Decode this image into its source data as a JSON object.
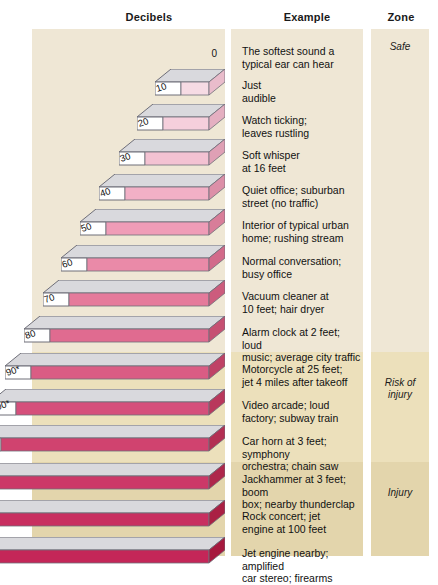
{
  "headers": {
    "decibels": "Decibels",
    "example": "Example",
    "zone": "Zone"
  },
  "zones": [
    {
      "id": "safe",
      "label": "Safe",
      "color": "#efe7d5"
    },
    {
      "id": "risk",
      "label": "Risk of\ninjury",
      "label_line1": "Risk of",
      "label_line2": "injury",
      "color": "#ece0bb"
    },
    {
      "id": "injury",
      "label": "Injury",
      "color": "#e3d5ac"
    }
  ],
  "chart_data": {
    "type": "bar",
    "xlabel": "Decibels",
    "ylabel": "",
    "categories": [
      "0",
      "10",
      "20",
      "30",
      "40",
      "50",
      "60",
      "70",
      "80",
      "90*",
      "100*",
      "110*",
      "120",
      "130",
      "140"
    ],
    "values": [
      0,
      10,
      20,
      30,
      40,
      50,
      60,
      70,
      80,
      90,
      100,
      110,
      120,
      130,
      140
    ],
    "xlim": [
      0,
      140
    ],
    "grid": false,
    "legend": "none",
    "series": [
      {
        "name": "Sound level (dB)",
        "values": [
          0,
          10,
          20,
          30,
          40,
          50,
          60,
          70,
          80,
          90,
          100,
          110,
          120,
          130,
          140
        ]
      }
    ]
  },
  "rows": [
    {
      "db": "0",
      "top": 6,
      "barwidth": 0,
      "fill": "",
      "shade": "",
      "zone": "safe",
      "example": [
        "The softest sound a",
        "typical ear can hear"
      ]
    },
    {
      "db": "10",
      "top": 40,
      "barwidth": 28,
      "fill": "#f6dbe4",
      "shade": "#e9bccb",
      "zone": "safe",
      "example": [
        "Just",
        "audible"
      ]
    },
    {
      "db": "20",
      "top": 75,
      "barwidth": 46,
      "fill": "#f5cfdc",
      "shade": "#e4afc1",
      "zone": "safe",
      "example": [
        "Watch ticking;",
        "leaves rustling"
      ]
    },
    {
      "db": "30",
      "top": 110,
      "barwidth": 64,
      "fill": "#f3c2d2",
      "shade": "#dfa0b5",
      "zone": "safe",
      "example": [
        "Soft whisper",
        "at 16 feet"
      ]
    },
    {
      "db": "40",
      "top": 145,
      "barwidth": 84,
      "fill": "#f2b0c6",
      "shade": "#dc8fa8",
      "zone": "safe",
      "example": [
        "Quiet office; suburban",
        "street (no traffic)"
      ]
    },
    {
      "db": "50",
      "top": 180,
      "barwidth": 103,
      "fill": "#ef9cb7",
      "shade": "#d87d99",
      "zone": "safe",
      "example": [
        "Interior of typical urban",
        "home; rushing stream"
      ]
    },
    {
      "db": "60",
      "top": 216,
      "barwidth": 122,
      "fill": "#ea8aa8",
      "shade": "#d26a8a",
      "zone": "safe",
      "example": [
        "Normal conversation;",
        "busy office"
      ]
    },
    {
      "db": "70",
      "top": 251,
      "barwidth": 140,
      "fill": "#e57a9b",
      "shade": "#cc5c7d",
      "zone": "safe",
      "example": [
        "Vacuum cleaner at",
        "10 feet; hair dryer"
      ]
    },
    {
      "db": "80",
      "top": 287,
      "barwidth": 159,
      "fill": "#e06b90",
      "shade": "#c64f72",
      "zone": "safe",
      "example": [
        "Alarm clock at 2 feet; loud",
        "music; average city traffic"
      ]
    },
    {
      "db": "90*",
      "top": 324,
      "barwidth": 178,
      "fill": "#da5c84",
      "shade": "#bf4266",
      "zone": "risk",
      "example": [
        "Motorcycle at 25 feet;",
        "jet 4 miles after takeoff"
      ]
    },
    {
      "db": "100*",
      "top": 360,
      "barwidth": 193,
      "fill": "#d54f7b",
      "shade": "#b9375c",
      "zone": "risk",
      "example": [
        "Video arcade; loud",
        "factory; subway train"
      ]
    },
    {
      "db": "110*",
      "top": 396,
      "barwidth": 208,
      "fill": "#d0436f",
      "shade": "#b32f53",
      "zone": "risk",
      "example": [
        "Car horn at 3 feet; symphony",
        "orchestra; chain saw"
      ]
    },
    {
      "db": "120",
      "top": 434,
      "barwidth": 226,
      "fill": "#cc3868",
      "shade": "#ae274b",
      "zone": "injury",
      "example": [
        "Jackhammer at 3 feet; boom",
        "box; nearby thunderclap"
      ]
    },
    {
      "db": "130",
      "top": 471,
      "barwidth": 242,
      "fill": "#c82f60",
      "shade": "#aa2044",
      "zone": "injury",
      "example": [
        "Rock concert; jet",
        "engine at 100 feet"
      ]
    },
    {
      "db": "140",
      "top": 508,
      "barwidth": 258,
      "fill": "#c42658",
      "shade": "#a6193e",
      "zone": "injury",
      "example": [
        "Jet engine nearby; amplified",
        "car stereo; firearms"
      ]
    }
  ],
  "colors": {
    "panel_safe": "#efe7d5",
    "panel_risk": "#ece0bb",
    "panel_injury": "#e3d5ac",
    "bar_top": "#d9d9dd",
    "bar_outline": "#6e6e78",
    "label_face": "#ffffff",
    "text": "#111111"
  }
}
